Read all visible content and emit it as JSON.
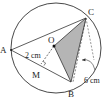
{
  "figure": {
    "points": {
      "A": {
        "label": "A",
        "x": 11,
        "y": 50
      },
      "B": {
        "label": "B",
        "x": 71,
        "y": 82
      },
      "C": {
        "label": "C",
        "x": 86,
        "y": 18
      },
      "O": {
        "label": "O",
        "x": 54,
        "y": 46
      },
      "M": {
        "label": "M",
        "x": 41,
        "y": 64
      }
    },
    "circle": {
      "cx": 56,
      "cy": 48,
      "r": 45
    },
    "labels": {
      "om_length": "2 cm",
      "arc_length": "6 cm"
    },
    "colors": {
      "shade": "#b5b5b5",
      "stroke": "#333333"
    }
  }
}
